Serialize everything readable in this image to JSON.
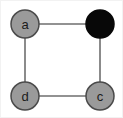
{
  "figure": {
    "width": 123,
    "height": 118,
    "background_color": "#ffffff",
    "border_color": "#f2f2f2"
  },
  "graph_data": {
    "type": "node-link-diagram",
    "layout": "square-cycle",
    "directed": false,
    "node_radius": 14,
    "nodes": [
      {
        "id": "a",
        "label": "a",
        "cx": 24,
        "cy": 23,
        "state": "unvisited",
        "fill_color": "#9a9a9a",
        "stroke_color": "#4a4a4a",
        "label_color": "#1a1a1a",
        "label_visible": true
      },
      {
        "id": "b",
        "label": "",
        "cx": 99,
        "cy": 23,
        "state": "visited",
        "fill_color": "#080808",
        "stroke_color": "#080808",
        "label_color": "#080808",
        "label_visible": false
      },
      {
        "id": "c",
        "label": "c",
        "cx": 99,
        "cy": 95,
        "state": "unvisited",
        "fill_color": "#9a9a9a",
        "stroke_color": "#4a4a4a",
        "label_color": "#1a1a1a",
        "label_visible": true
      },
      {
        "id": "d",
        "label": "d",
        "cx": 24,
        "cy": 95,
        "state": "unvisited",
        "fill_color": "#9a9a9a",
        "stroke_color": "#4a4a4a",
        "label_color": "#1a1a1a",
        "label_visible": true
      }
    ],
    "edges": [
      {
        "id": "a-b",
        "source": "a",
        "target": "b",
        "x1": 24,
        "y1": 23,
        "x2": 99,
        "y2": 23,
        "color": "#6e6e6e",
        "width": 1.6
      },
      {
        "id": "a-d",
        "source": "a",
        "target": "d",
        "x1": 24,
        "y1": 23,
        "x2": 24,
        "y2": 95,
        "color": "#6e6e6e",
        "width": 1.6
      },
      {
        "id": "d-c",
        "source": "d",
        "target": "c",
        "x1": 24,
        "y1": 95,
        "x2": 99,
        "y2": 95,
        "color": "#6e6e6e",
        "width": 1.6
      },
      {
        "id": "b-c",
        "source": "b",
        "target": "c",
        "x1": 99,
        "y1": 23,
        "x2": 99,
        "y2": 95,
        "color": "#6e6e6e",
        "width": 1.6
      }
    ]
  }
}
